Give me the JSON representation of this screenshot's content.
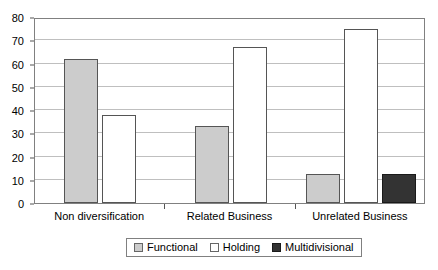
{
  "chart_data": {
    "type": "bar",
    "title": "",
    "subtitle": "",
    "xlabel": "",
    "ylabel": "",
    "ylim": [
      0,
      80
    ],
    "ytick_step": 10,
    "yticks": [
      0,
      10,
      20,
      30,
      40,
      50,
      60,
      70,
      80
    ],
    "ytick_labels": [
      "0",
      "10",
      "20",
      "30",
      "40",
      "50",
      "60",
      "70",
      "80"
    ],
    "grid": true,
    "grid_axis": "y",
    "legend_position": "bottom",
    "categories": [
      "Non diversification",
      "Related Business",
      "Unrelated Business"
    ],
    "series": [
      {
        "name": "Functional",
        "color": "#cccccc",
        "values": [
          62,
          33,
          12.5
        ]
      },
      {
        "name": "Holding",
        "color": "#ffffff",
        "values": [
          38,
          67,
          75
        ]
      },
      {
        "name": "Multidivisional",
        "color": "#333333",
        "values": [
          0,
          0,
          12.5
        ]
      }
    ]
  },
  "legend": {
    "items": [
      {
        "label": "Functional",
        "swatch": "series-functional"
      },
      {
        "label": "Holding",
        "swatch": "series-holding"
      },
      {
        "label": "Multidivisional",
        "swatch": "series-multidivisional"
      }
    ]
  },
  "colors": {
    "functional": "#cccccc",
    "holding": "#ffffff",
    "multidivisional": "#333333",
    "gridline": "#bfbfbf",
    "axis": "#808080",
    "text": "#000000",
    "background": "#ffffff"
  }
}
